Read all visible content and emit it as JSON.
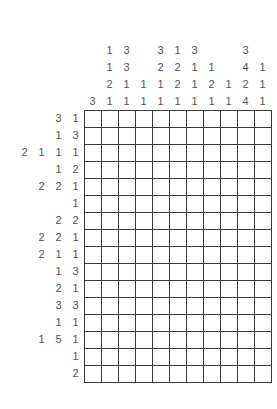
{
  "puzzle": {
    "type": "nonogram",
    "columns": 11,
    "rows": 16,
    "cell_size": 17,
    "grid_color": "#3a3a3a",
    "clue_color": "#555555",
    "cell_color": "#ffffff",
    "background": "#ffffff",
    "max_col_clue_depth": 4,
    "max_row_clue_width": 4,
    "column_clues": [
      [
        3
      ],
      [
        1,
        1,
        2,
        1
      ],
      [
        3,
        3,
        1,
        1
      ],
      [
        1,
        1
      ],
      [
        3,
        2,
        1,
        1
      ],
      [
        1,
        2,
        2,
        1
      ],
      [
        3,
        1,
        1,
        1
      ],
      [
        1,
        2,
        1
      ],
      [
        1,
        1
      ],
      [
        3,
        4,
        2,
        4
      ],
      [
        1,
        1,
        1
      ]
    ],
    "row_clues": [
      [
        3,
        1
      ],
      [
        1,
        3
      ],
      [
        2,
        1,
        1,
        1
      ],
      [
        1,
        2
      ],
      [
        2,
        2,
        1
      ],
      [
        1
      ],
      [
        2,
        2
      ],
      [
        2,
        2,
        1
      ],
      [
        2,
        1,
        1
      ],
      [
        1,
        3
      ],
      [
        2,
        1
      ],
      [
        3,
        3
      ],
      [
        1,
        1
      ],
      [
        1,
        5,
        1
      ],
      [
        1
      ],
      [
        2
      ]
    ]
  }
}
